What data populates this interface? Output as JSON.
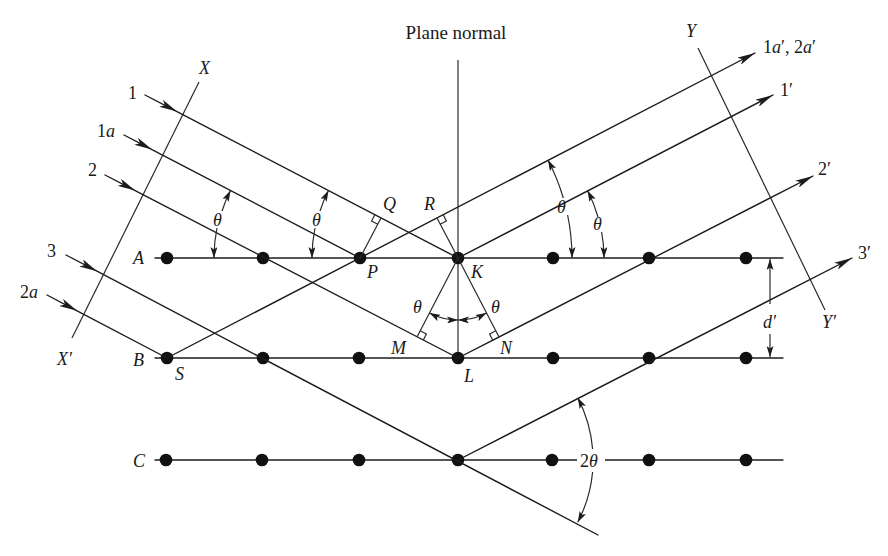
{
  "figure": {
    "type": "bragg-diffraction-geometry",
    "title": "Plane normal"
  },
  "axes": {
    "X": "X",
    "X_prime": "X′",
    "Y": "Y",
    "Y_prime": "Y′"
  },
  "planes": {
    "labels": [
      "A",
      "B",
      "C"
    ],
    "points_per_plane": 7
  },
  "points": {
    "P": "P",
    "Q": "Q",
    "R": "R",
    "K": "K",
    "M": "M",
    "N": "N",
    "L": "L",
    "S": "S"
  },
  "incident_rays": [
    {
      "num": "1",
      "letter": ""
    },
    {
      "num": "1",
      "letter": "a"
    },
    {
      "num": "2",
      "letter": ""
    },
    {
      "num": "3",
      "letter": ""
    },
    {
      "num": "2",
      "letter": "a"
    }
  ],
  "reflected_rays": [
    {
      "label": "1a′, 2a′",
      "parts": [
        "1",
        "a",
        "′, 2",
        "a",
        "′"
      ]
    },
    {
      "label": "1′"
    },
    {
      "label": "2′"
    },
    {
      "label": "3′"
    }
  ],
  "angles": {
    "theta": "θ",
    "two_theta": {
      "num": "2",
      "symbol": "θ"
    }
  },
  "spacing": {
    "label": "d′"
  },
  "colors": {
    "ink": "#1c1c1c",
    "background": "#ffffff"
  }
}
